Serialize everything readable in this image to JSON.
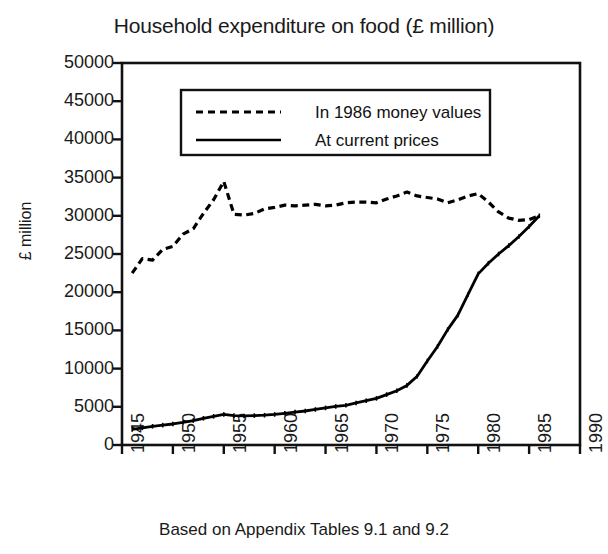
{
  "chart_data": {
    "type": "line",
    "title": "Household expenditure on food (£ million)",
    "xlabel": "",
    "ylabel": "£ million",
    "caption": "Based on Appendix Tables 9.1 and 9.2",
    "grid": false,
    "legend_position": "upper-left-inside",
    "xlim": [
      1945,
      1990
    ],
    "ylim": [
      0,
      50000
    ],
    "xticks": [
      1945,
      1950,
      1955,
      1960,
      1965,
      1970,
      1975,
      1980,
      1985,
      1990
    ],
    "xticklabels": [
      "1945",
      "1950",
      "1955",
      "1960",
      "1965",
      "1970",
      "1975",
      "1980",
      "1985",
      "1990"
    ],
    "yticks": [
      0,
      5000,
      10000,
      15000,
      20000,
      25000,
      30000,
      35000,
      40000,
      45000,
      50000
    ],
    "yticklabels": [
      "0",
      "5000",
      "10000",
      "15000",
      "20000",
      "25000",
      "30000",
      "35000",
      "40000",
      "45000",
      "50000"
    ],
    "x": [
      1946,
      1947,
      1948,
      1949,
      1950,
      1951,
      1952,
      1953,
      1954,
      1955,
      1956,
      1957,
      1958,
      1959,
      1960,
      1961,
      1962,
      1963,
      1964,
      1965,
      1966,
      1967,
      1968,
      1969,
      1970,
      1971,
      1972,
      1973,
      1974,
      1975,
      1976,
      1977,
      1978,
      1979,
      1980,
      1981,
      1982,
      1983,
      1984,
      1985,
      1986
    ],
    "series": [
      {
        "name": "In 1986 money values",
        "style": "dashed",
        "color": "#000000",
        "values": [
          22500,
          24400,
          24200,
          25600,
          26000,
          27600,
          28300,
          30300,
          32100,
          34500,
          30200,
          30100,
          30300,
          30900,
          31100,
          31400,
          31300,
          31400,
          31500,
          31300,
          31400,
          31700,
          31800,
          31800,
          31700,
          32200,
          32600,
          33100,
          32600,
          32400,
          32200,
          31700,
          32100,
          32600,
          32900,
          31800,
          30500,
          29700,
          29400,
          29500,
          30000
        ]
      },
      {
        "name": "At current prices",
        "style": "solid",
        "color": "#000000",
        "values": [
          2050,
          2250,
          2450,
          2600,
          2750,
          2950,
          3200,
          3500,
          3750,
          4000,
          3850,
          3800,
          3850,
          3900,
          4000,
          4150,
          4300,
          4450,
          4650,
          4850,
          5050,
          5200,
          5500,
          5800,
          6100,
          6600,
          7100,
          7800,
          9000,
          11000,
          12900,
          15100,
          17000,
          19700,
          22400,
          23800,
          25000,
          26100,
          27300,
          28600,
          30000
        ]
      }
    ]
  },
  "legend": {
    "items": [
      {
        "label": "In 1986 money values",
        "style": "dashed"
      },
      {
        "label": "At current prices",
        "style": "solid"
      }
    ]
  }
}
